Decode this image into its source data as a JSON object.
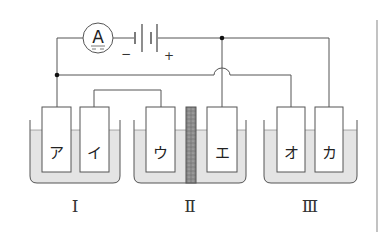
{
  "diagram": {
    "type": "electrochemical-circuit",
    "ammeter": {
      "label": "A"
    },
    "battery": {
      "negative_sign": "−",
      "positive_sign": "+"
    },
    "electrodes": [
      {
        "id": "a",
        "label": "ア",
        "cell": "I"
      },
      {
        "id": "i",
        "label": "イ",
        "cell": "I"
      },
      {
        "id": "u",
        "label": "ウ",
        "cell": "II"
      },
      {
        "id": "e",
        "label": "エ",
        "cell": "II"
      },
      {
        "id": "o",
        "label": "オ",
        "cell": "III"
      },
      {
        "id": "ka",
        "label": "カ",
        "cell": "III"
      }
    ],
    "cells": [
      {
        "id": "I",
        "label": "Ⅰ"
      },
      {
        "id": "II",
        "label": "Ⅱ"
      },
      {
        "id": "III",
        "label": "Ⅲ"
      }
    ],
    "colors": {
      "line": "#555555",
      "electrolyte": "#e4e4e4",
      "separator": "#8a8a8a",
      "electrode_fill": "#ffffff",
      "border": "#9a9a9a"
    }
  }
}
